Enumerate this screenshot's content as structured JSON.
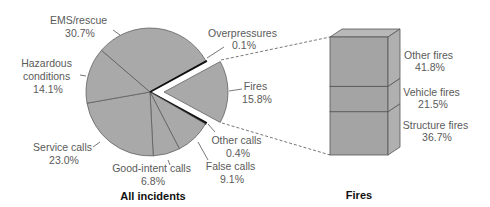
{
  "chart_data": [
    {
      "type": "pie",
      "title": "All incidents",
      "exploded_slice": "Fires",
      "slices": [
        {
          "label": "Fires",
          "value": 15.8,
          "text": "15.8%"
        },
        {
          "label": "Other calls",
          "value": 0.4,
          "text": "0.4%"
        },
        {
          "label": "False calls",
          "value": 9.1,
          "text": "9.1%"
        },
        {
          "label": "Good-intent calls",
          "value": 6.8,
          "text": "6.8%"
        },
        {
          "label": "Service calls",
          "value": 23.0,
          "text": "23.0%"
        },
        {
          "label": "Hazardous conditions",
          "value": 14.1,
          "text": "14.1%"
        },
        {
          "label": "EMS/rescue",
          "value": 30.7,
          "text": "30.7%"
        },
        {
          "label": "Overpressures",
          "value": 0.1,
          "text": "0.1%"
        }
      ]
    },
    {
      "type": "bar",
      "subtype": "stacked-3d-column",
      "title": "Fires",
      "categories": [
        "Structure fires",
        "Vehicle fires",
        "Other fires"
      ],
      "values": [
        36.7,
        21.5,
        41.8
      ],
      "texts": [
        "36.7%",
        "21.5%",
        "41.8%"
      ]
    }
  ],
  "labels": {
    "ems": [
      "EMS/rescue",
      "30.7%"
    ],
    "hazardous": [
      "Hazardous",
      "conditions",
      "14.1%"
    ],
    "service": [
      "Service calls",
      "23.0%"
    ],
    "good_intent": [
      "Good-intent calls",
      "6.8%"
    ],
    "false_calls": [
      "False calls",
      "9.1%"
    ],
    "other_calls": [
      "Other calls",
      "0.4%"
    ],
    "fires": [
      "Fires",
      "15.8%"
    ],
    "overpressures": [
      "Overpressures",
      "0.1%"
    ],
    "other_fires": [
      "Other fires",
      "41.8%"
    ],
    "vehicle_fires": [
      "Vehicle fires",
      "21.5%"
    ],
    "structure_fires": [
      "Structure fires",
      "36.7%"
    ]
  },
  "titles": {
    "pie": "All incidents",
    "bar": "Fires"
  },
  "colors": {
    "slice": "#a9a9a9",
    "edge": "#555555",
    "box_front": "#a4a4a4",
    "box_side": "#b0b0b0",
    "box_top": "#b8b8b8",
    "thin_slice": "#111111"
  }
}
